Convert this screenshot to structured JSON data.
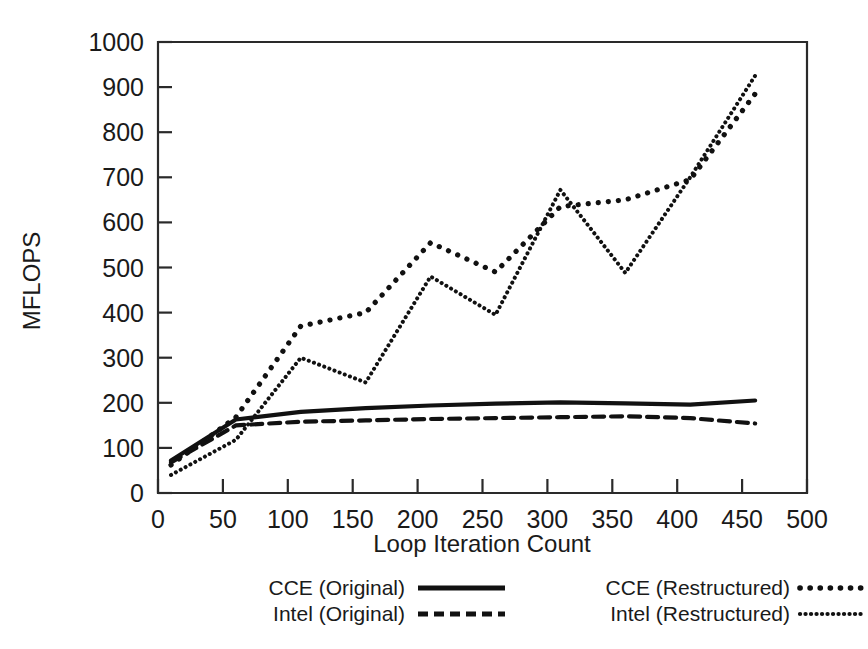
{
  "chart_data": {
    "type": "line",
    "title": "",
    "xlabel": "Loop Iteration Count",
    "ylabel": "MFLOPS",
    "xlim": [
      0,
      500
    ],
    "ylim": [
      0,
      1000
    ],
    "xticks": [
      0,
      50,
      100,
      150,
      200,
      250,
      300,
      350,
      400,
      450,
      500
    ],
    "xtick_labels": [
      "0",
      "50",
      "100",
      "150",
      "200",
      "250",
      "300",
      "350",
      "400",
      "450",
      "500"
    ],
    "yticks": [
      0,
      100,
      200,
      300,
      400,
      500,
      600,
      700,
      800,
      900,
      1000
    ],
    "ytick_labels": [
      "0",
      "100",
      "200",
      "300",
      "400",
      "500",
      "600",
      "700",
      "800",
      "900",
      "1000"
    ],
    "grid": false,
    "legend_position": "below-axes",
    "x": [
      10,
      60,
      110,
      160,
      210,
      260,
      310,
      360,
      410,
      460
    ],
    "series": [
      {
        "name": "CCE (Original)",
        "style": "solid",
        "values": [
          72,
          163,
          180,
          188,
          194,
          198,
          201,
          199,
          196,
          205
        ]
      },
      {
        "name": "Intel (Original)",
        "style": "dashed",
        "values": [
          68,
          150,
          158,
          161,
          164,
          166,
          168,
          170,
          166,
          154
        ]
      },
      {
        "name": "CCE (Restructured)",
        "style": "dotted",
        "values": [
          62,
          168,
          370,
          400,
          555,
          490,
          635,
          650,
          695,
          885
        ]
      },
      {
        "name": "Intel (Restructured)",
        "style": "fine-dotted",
        "values": [
          40,
          118,
          300,
          245,
          480,
          395,
          672,
          488,
          700,
          925
        ]
      }
    ]
  },
  "legend": {
    "entries": [
      {
        "label": "CCE (Original)",
        "style": "solid"
      },
      {
        "label": "Intel (Original)",
        "style": "dashed"
      },
      {
        "label": "CCE (Restructured)",
        "style": "dotted"
      },
      {
        "label": "Intel (Restructured)",
        "style": "fine-dotted"
      }
    ]
  },
  "axes": {
    "x_title": "Loop Iteration Count",
    "y_title": "MFLOPS"
  },
  "colors": {
    "ink": "#111111",
    "frame": "#2a2a2a",
    "background": "#ffffff"
  }
}
